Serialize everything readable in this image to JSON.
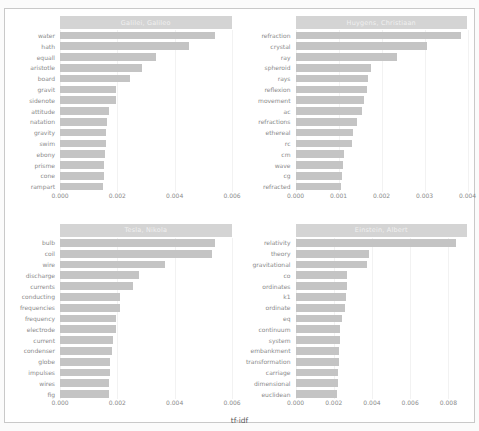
{
  "chart_data": [
    {
      "type": "bar",
      "title": "Galilei, Galileo",
      "orientation": "horizontal",
      "xlabel": "tf-idf",
      "ylabel": "",
      "xlim": [
        0,
        0.006
      ],
      "xticks": [
        "0.000",
        "0.002",
        "0.004",
        "0.006"
      ],
      "xtick_values": [
        0.0,
        0.002,
        0.004,
        0.006
      ],
      "grid": true,
      "categories": [
        "water",
        "hath",
        "equall",
        "aristotle",
        "board",
        "gravit",
        "sidenote",
        "attitude",
        "natation",
        "gravity",
        "swim",
        "ebony",
        "prisme",
        "cone",
        "rampart"
      ],
      "values": [
        0.0054,
        0.0045,
        0.00335,
        0.00285,
        0.00245,
        0.00196,
        0.00194,
        0.00172,
        0.00164,
        0.00162,
        0.0016,
        0.00157,
        0.00155,
        0.00152,
        0.0015
      ]
    },
    {
      "type": "bar",
      "title": "Huygens, Christiaan",
      "orientation": "horizontal",
      "xlabel": "tf-idf",
      "ylabel": "",
      "xlim": [
        0,
        0.004
      ],
      "xticks": [
        "0.000",
        "0.001",
        "0.002",
        "0.003",
        "0.004"
      ],
      "xtick_values": [
        0.0,
        0.001,
        0.002,
        0.003,
        0.004
      ],
      "grid": true,
      "categories": [
        "refraction",
        "crystal",
        "ray",
        "spheroid",
        "rays",
        "reflexion",
        "movement",
        "ac",
        "refractions",
        "ethereal",
        "rc",
        "cm",
        "wave",
        "cg",
        "refracted"
      ],
      "values": [
        0.00385,
        0.00305,
        0.00235,
        0.00175,
        0.00168,
        0.00166,
        0.0016,
        0.00155,
        0.00143,
        0.00133,
        0.00131,
        0.00113,
        0.0011,
        0.00107,
        0.00105
      ]
    },
    {
      "type": "bar",
      "title": "Tesla, Nikola",
      "orientation": "horizontal",
      "xlabel": "tf-idf",
      "ylabel": "",
      "xlim": [
        0,
        0.006
      ],
      "xticks": [
        "0.000",
        "0.002",
        "0.004",
        "0.006"
      ],
      "xtick_values": [
        0.0,
        0.002,
        0.004,
        0.006
      ],
      "grid": true,
      "categories": [
        "bulb",
        "coil",
        "wire",
        "discharge",
        "currents",
        "conducting",
        "frequencies",
        "frequency",
        "electrode",
        "current",
        "condenser",
        "globe",
        "impulses",
        "wires",
        "fig"
      ],
      "values": [
        0.0054,
        0.0053,
        0.00365,
        0.00275,
        0.00255,
        0.0021,
        0.0021,
        0.00196,
        0.00195,
        0.00185,
        0.0018,
        0.00175,
        0.00173,
        0.00172,
        0.0017
      ]
    },
    {
      "type": "bar",
      "title": "Einstein, Albert",
      "orientation": "horizontal",
      "xlabel": "tf-idf",
      "ylabel": "",
      "xlim": [
        0,
        0.009
      ],
      "xticks": [
        "0.000",
        "0.002",
        "0.004",
        "0.006",
        "0.008"
      ],
      "xtick_values": [
        0.0,
        0.002,
        0.004,
        0.006,
        0.008
      ],
      "grid": true,
      "categories": [
        "relativity",
        "theory",
        "gravitational",
        "co",
        "ordinates",
        "k1",
        "ordinate",
        "eq",
        "continuum",
        "system",
        "embankment",
        "transformation",
        "carriage",
        "dimensional",
        "euclidean"
      ],
      "values": [
        0.0084,
        0.00385,
        0.00375,
        0.00268,
        0.00268,
        0.00262,
        0.00258,
        0.00243,
        0.00235,
        0.00232,
        0.00228,
        0.00226,
        0.00222,
        0.0022,
        0.00218
      ]
    }
  ],
  "figure": {
    "xaxis_title": "tf-idf",
    "bar_color": "#c4c4c4",
    "strip_color": "#d4d4d4",
    "strip_text_color": "#f0f0f0",
    "tick_text_color": "#8a8a8a",
    "background": "#ffffff"
  }
}
